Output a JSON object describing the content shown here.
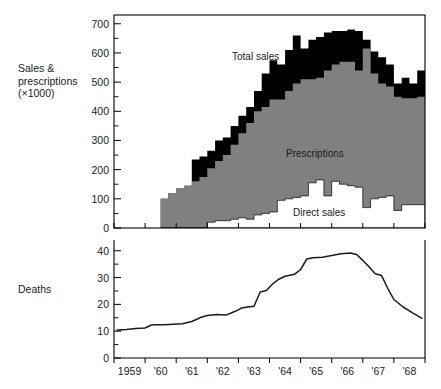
{
  "labels": {
    "sales_axis": "Sales &\nprescriptions\n(×1000)",
    "deaths_axis": "Deaths",
    "total_sales": "Total sales",
    "prescriptions": "Prescriptions",
    "direct_sales": "Direct sales"
  },
  "colors": {
    "total_sales": "#000000",
    "prescriptions": "#808080",
    "direct_sales": "#ffffff",
    "deaths_line": "#1a1a1a",
    "axis": "#000000",
    "background": "#ffffff"
  },
  "chart_data": [
    {
      "type": "area",
      "title": "",
      "xlabel": "",
      "ylabel": "Sales & prescriptions (×1000)",
      "ylim": [
        0,
        730
      ],
      "yticks": [
        0,
        100,
        200,
        300,
        400,
        500,
        600,
        700
      ],
      "ytick_labels": [
        "0",
        "100",
        "200",
        "300",
        "400",
        "500",
        "600",
        "700"
      ],
      "yminor_step": 50,
      "xlim": [
        1959.0,
        1969.0
      ],
      "xticks": [
        1959,
        1960,
        1961,
        1962,
        1963,
        1964,
        1965,
        1966,
        1967,
        1968,
        1969
      ],
      "xtick_labels": [
        "1959",
        "'60",
        "'61",
        "'62",
        "'63",
        "'64",
        "'65",
        "'66",
        "'67",
        "'68"
      ],
      "grid": false,
      "legend": "inline-annotations",
      "stacking": "stacked",
      "note": "step/stair stacked area; data begins mid-1960",
      "x": [
        1960.5,
        1960.75,
        1961.0,
        1961.25,
        1961.5,
        1961.75,
        1962.0,
        1962.25,
        1962.5,
        1962.75,
        1963.0,
        1963.25,
        1963.5,
        1963.75,
        1964.0,
        1964.25,
        1964.5,
        1964.75,
        1965.0,
        1965.25,
        1965.5,
        1965.75,
        1966.0,
        1966.25,
        1966.5,
        1966.75,
        1967.0,
        1967.25,
        1967.5,
        1967.75,
        1968.0,
        1968.25,
        1968.5,
        1968.75
      ],
      "series": [
        {
          "name": "Direct sales",
          "color": "#ffffff",
          "values": [
            0,
            0,
            0,
            0,
            0,
            0,
            20,
            25,
            25,
            30,
            35,
            30,
            45,
            50,
            55,
            95,
            100,
            105,
            110,
            155,
            165,
            110,
            160,
            150,
            145,
            140,
            70,
            100,
            105,
            110,
            60,
            80,
            80,
            80
          ]
        },
        {
          "name": "Prescriptions",
          "color": "#808080",
          "values": [
            100,
            120,
            135,
            145,
            160,
            175,
            185,
            205,
            225,
            255,
            290,
            330,
            355,
            365,
            385,
            345,
            370,
            390,
            400,
            355,
            350,
            430,
            400,
            420,
            425,
            400,
            545,
            430,
            390,
            375,
            390,
            365,
            365,
            370
          ]
        },
        {
          "name": "Total sales",
          "color": "#000000",
          "values": [
            0,
            0,
            0,
            0,
            75,
            70,
            60,
            70,
            60,
            65,
            60,
            55,
            70,
            115,
            135,
            120,
            140,
            165,
            105,
            135,
            140,
            130,
            115,
            105,
            110,
            135,
            30,
            75,
            90,
            75,
            45,
            70,
            50,
            90
          ]
        }
      ],
      "series_totals_note": "top of stack = total sales peak ~675 in 1966",
      "annotations": [
        {
          "text": "Total sales",
          "x": 1964.0,
          "y": 605
        },
        {
          "text": "Prescriptions",
          "x": 1965.0,
          "y": 270
        },
        {
          "text": "Direct sales",
          "x": 1965.6,
          "y": 60
        }
      ]
    },
    {
      "type": "line",
      "title": "",
      "xlabel": "",
      "ylabel": "Deaths",
      "ylim": [
        0,
        44
      ],
      "yticks": [
        0,
        10,
        20,
        30,
        40
      ],
      "ytick_labels": [
        "0",
        "10",
        "20",
        "30",
        "40"
      ],
      "yminor_step": 5,
      "xlim": [
        1959.0,
        1969.0
      ],
      "xticks": [
        1959,
        1960,
        1961,
        1962,
        1963,
        1964,
        1965,
        1966,
        1967,
        1968,
        1969
      ],
      "xtick_labels": [
        "1959",
        "'60",
        "'61",
        "'62",
        "'63",
        "'64",
        "'65",
        "'66",
        "'67",
        "'68"
      ],
      "grid": false,
      "series": [
        {
          "name": "Deaths",
          "color": "#1a1a1a",
          "x": [
            1959.1,
            1959.4,
            1959.7,
            1960.0,
            1960.2,
            1960.4,
            1960.6,
            1960.9,
            1961.2,
            1961.5,
            1961.8,
            1962.0,
            1962.3,
            1962.6,
            1962.9,
            1963.1,
            1963.3,
            1963.5,
            1963.7,
            1963.9,
            1964.1,
            1964.3,
            1964.5,
            1964.8,
            1965.0,
            1965.2,
            1965.4,
            1965.7,
            1966.0,
            1966.3,
            1966.6,
            1966.8,
            1967.0,
            1967.2,
            1967.4,
            1967.6,
            1967.8,
            1968.0,
            1968.3,
            1968.6,
            1968.9
          ],
          "values": [
            10.4,
            10.6,
            11.0,
            11.2,
            12.3,
            12.4,
            12.4,
            12.6,
            12.8,
            13.6,
            15.2,
            15.8,
            16.2,
            16.0,
            17.4,
            18.6,
            19.0,
            19.3,
            24.6,
            25.2,
            27.6,
            29.4,
            30.5,
            31.2,
            33.0,
            36.9,
            37.4,
            37.6,
            38.2,
            38.9,
            39.2,
            38.6,
            36.4,
            34.0,
            31.4,
            30.8,
            26.0,
            21.8,
            19.0,
            16.8,
            14.8
          ]
        }
      ]
    }
  ]
}
